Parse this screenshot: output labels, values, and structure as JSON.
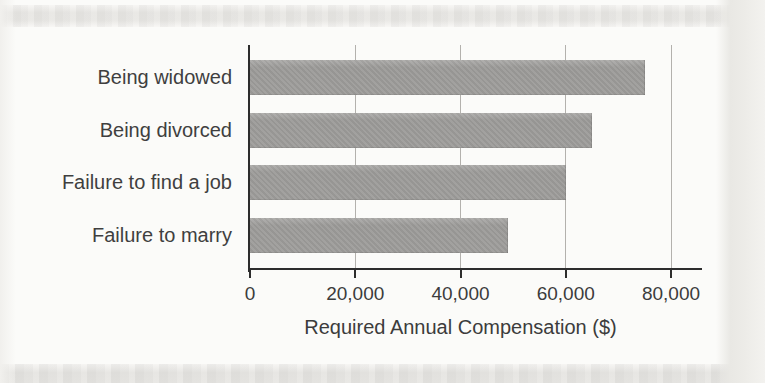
{
  "page": {
    "background_color": "#fbfbf9",
    "band_color": "#e9e8e5"
  },
  "chart_data": {
    "type": "bar",
    "orientation": "horizontal",
    "title": "",
    "categories": [
      "Being widowed",
      "Being divorced",
      "Failure to find a job",
      "Failure to marry"
    ],
    "values": [
      75000,
      65000,
      60000,
      49000
    ],
    "xlabel": "Required Annual Compensation ($)",
    "ylabel": "",
    "xticks": [
      0,
      20000,
      40000,
      60000,
      80000
    ],
    "xtick_labels": [
      "0",
      "20,000",
      "40,000",
      "60,000",
      "80,000"
    ],
    "xlim": [
      0,
      86000
    ],
    "grid": true,
    "legend": "none",
    "bar_color": "#9e9d9b",
    "grid_color": "#b3b1ad",
    "axis_color": "#2d2d2d",
    "text_color": "#3c3c3c"
  }
}
